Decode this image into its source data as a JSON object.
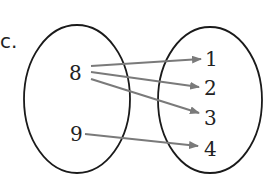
{
  "part_label": "c.",
  "domain_set": {
    "elements": [
      "8",
      "9"
    ]
  },
  "range_set": {
    "elements": [
      "1",
      "2",
      "3",
      "4"
    ]
  },
  "mappings": [
    {
      "from": "8",
      "to": "1"
    },
    {
      "from": "8",
      "to": "2"
    },
    {
      "from": "8",
      "to": "3"
    },
    {
      "from": "9",
      "to": "4"
    }
  ],
  "colors": {
    "outline": "#1a1a1a",
    "arrow": "#7a7a7a",
    "text": "#222222"
  }
}
